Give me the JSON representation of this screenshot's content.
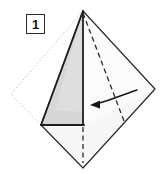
{
  "figure": {
    "kind": "origami-fold-step-diagram",
    "width": 174,
    "height": 174,
    "background_color": "#ffffff",
    "step_label": "1"
  },
  "step_badge": {
    "label": "1",
    "border_color": "#2a2a2a",
    "background_color": "#ffffff",
    "text_color": "#141414"
  },
  "colors": {
    "paper_front_fill": "#ffffff",
    "paper_shaded_fill": "#d6d6d6",
    "paper_shaded_fill_light": "#e3e3e3",
    "solid_edge": "#1f1f1f",
    "ghost_edge": "#b8b8b8",
    "crease_dashed": "#2b2b2b",
    "arrow_color": "#151515"
  },
  "geometry": {
    "ghost_square": {
      "name": "original-square-outline",
      "style": "dotted",
      "points": "83,11 11,94 83,168 155,89"
    },
    "folded_sheet": {
      "name": "folded-paper-outline",
      "style": "solid",
      "points": "83,11 155,89 83,168 41,125"
    },
    "shaded_flap": {
      "name": "shaded-flap-triangle",
      "points": "83,11 41,125 84,125"
    },
    "lower_panel": {
      "name": "lower-panel",
      "points": "41,125 84,125 155,89 83,168"
    },
    "vertical_edge": {
      "name": "flap-vertical-edge",
      "points": "83,11 83,125"
    },
    "bottom_edge": {
      "name": "flap-bottom-edge",
      "points": "41,125 84,125"
    },
    "crease_diagonal": {
      "name": "diagonal-crease",
      "style": "dashed",
      "points": "83,12 124,122"
    },
    "crease_vertical": {
      "name": "vertical-crease",
      "style": "dashed",
      "points": "83,126 83,164"
    },
    "fold_arrow": {
      "name": "fold-direction-arrow",
      "path": "M 136,91 C 126,93 110,100 95,104",
      "head": "92,104 100,100 100,108",
      "direction": "right-to-left"
    }
  },
  "legend": {
    "dotted_meaning": "original square outline",
    "dashed_meaning": "valley fold crease",
    "arrow_meaning": "fold this flap to the left"
  }
}
